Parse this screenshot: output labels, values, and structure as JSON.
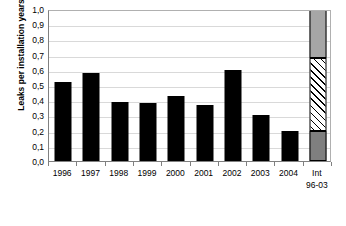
{
  "chart_data": {
    "type": "bar",
    "title": "",
    "subtitle": "",
    "xlabel": "",
    "ylabel": "Leaks per installation years",
    "ylim": [
      0.0,
      1.0
    ],
    "grid": true,
    "legend": "none",
    "decimal_separator": ",",
    "categories": [
      "1996",
      "1997",
      "1998",
      "1999",
      "2000",
      "2001",
      "2002",
      "2003",
      "2004",
      "Int 96-03"
    ],
    "category_labels": [
      {
        "line1": "1996",
        "line2": ""
      },
      {
        "line1": "1997",
        "line2": ""
      },
      {
        "line1": "1998",
        "line2": ""
      },
      {
        "line1": "1999",
        "line2": ""
      },
      {
        "line1": "2000",
        "line2": ""
      },
      {
        "line1": "2001",
        "line2": ""
      },
      {
        "line1": "2002",
        "line2": ""
      },
      {
        "line1": "2003",
        "line2": ""
      },
      {
        "line1": "2004",
        "line2": ""
      },
      {
        "line1": "Int",
        "line2": "96-03"
      }
    ],
    "values": [
      0.52,
      0.58,
      0.39,
      0.38,
      0.43,
      0.37,
      0.6,
      0.3,
      0.2,
      1.0
    ],
    "series": [
      {
        "name": "Leaks per installation years",
        "values": [
          0.52,
          0.58,
          0.39,
          0.38,
          0.43,
          0.37,
          0.6,
          0.3,
          0.2,
          null
        ],
        "color": "#000000"
      }
    ],
    "stacked_bar": {
      "category": "Int 96-03",
      "segments": [
        {
          "name": "lower",
          "from": 0.0,
          "to": 0.2,
          "fill": "dark-gray",
          "color": "#7f7f7f"
        },
        {
          "name": "middle",
          "from": 0.2,
          "to": 0.68,
          "fill": "diagonal-hatch",
          "color": "#ffffff"
        },
        {
          "name": "upper",
          "from": 0.68,
          "to": 1.0,
          "fill": "gray",
          "color": "#a6a6a6"
        }
      ]
    },
    "y_ticks": [
      {
        "value": 1.0,
        "label": "1,0"
      },
      {
        "value": 0.9,
        "label": "0,9"
      },
      {
        "value": 0.8,
        "label": "0,8"
      },
      {
        "value": 0.7,
        "label": "0,7"
      },
      {
        "value": 0.6,
        "label": "0,6"
      },
      {
        "value": 0.5,
        "label": "0,5"
      },
      {
        "value": 0.4,
        "label": "0,4"
      },
      {
        "value": 0.3,
        "label": "0,3"
      },
      {
        "value": 0.2,
        "label": "0,2"
      },
      {
        "value": 0.1,
        "label": "0,1"
      },
      {
        "value": 0.0,
        "label": "0,0"
      }
    ],
    "colors": {
      "bar": "#000000",
      "gridline": "#d9d9d9",
      "axis": "#808080",
      "background": "#ffffff",
      "stack_gray": "#a6a6a6",
      "stack_dark_gray": "#7f7f7f"
    }
  }
}
